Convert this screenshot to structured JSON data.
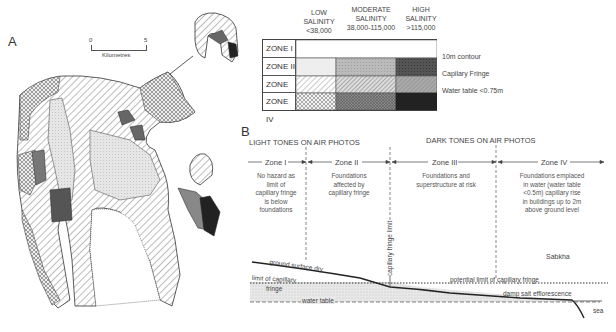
{
  "panel_a": {
    "label": "A",
    "scale_bar": {
      "start": "0",
      "end": "5",
      "unit": "Kilometres"
    }
  },
  "legend": {
    "columns": [
      {
        "line1": "LOW",
        "line2": "SALINITY",
        "line3": "<38,000"
      },
      {
        "line1": "MODERATE",
        "line2": "SALINITY",
        "line3": "38,000-115,000"
      },
      {
        "line1": "HIGH",
        "line2": "SALINITY",
        "line3": ">115,000"
      }
    ],
    "rows": [
      {
        "zone": "ZONE I"
      },
      {
        "zone": "ZONE II"
      },
      {
        "zone": "ZONE III"
      },
      {
        "zone": "ZONE IV"
      }
    ],
    "side_labels": [
      "10m contour",
      "Capilary Fringe",
      "Water table <0.75m"
    ]
  },
  "panel_b": {
    "label": "B",
    "light_tones": "LIGHT TONES ON AIR PHOTOS",
    "dark_tones": "DARK TONES ON AIR PHOTOS",
    "zones": [
      {
        "name": "Zone I",
        "desc": [
          "No hazard as",
          "limit of",
          "capillary fringe",
          "is below",
          "foundations"
        ]
      },
      {
        "name": "Zone II",
        "desc": [
          "Foundations",
          "affected by",
          "capillary fringe"
        ]
      },
      {
        "name": "Zone III",
        "desc": [
          "Foundations and",
          "superstructure at risk"
        ]
      },
      {
        "name": "Zone IV",
        "desc": [
          "Foundations  emplaced",
          "in water (water table",
          "<0.5m) capillary rise",
          "in buildings up to 2m",
          "above ground level"
        ]
      }
    ],
    "annotations": {
      "ground_surface": "ground surface dry",
      "limit_capillary_1": "limit of capillary",
      "limit_capillary_2": "fringe",
      "water_table": "water table",
      "capillary_fringe_limit": "capillary fringe limit",
      "potential_limit": "potential limit of capillary fringe",
      "damp_salt": "damp salt  efflorescence",
      "sabkha": "Sabkha",
      "sea": "sea"
    }
  }
}
